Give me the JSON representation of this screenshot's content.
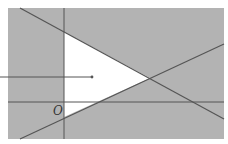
{
  "diagram": {
    "origin_label": "O",
    "colors": {
      "shade": "#b3b3b3",
      "region": "#ffffff",
      "lines": "#555555"
    }
  }
}
